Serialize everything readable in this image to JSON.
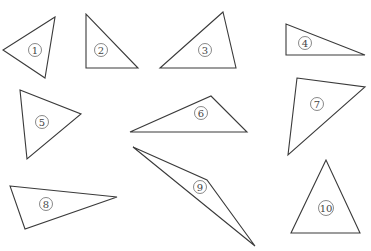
{
  "diagram": {
    "stroke_color": "#3a3a3a",
    "background": "#ffffff",
    "triangles": [
      {
        "label": "1",
        "points": "55,17 3,50 45,78",
        "label_x": 35,
        "label_y": 50
      },
      {
        "label": "2",
        "points": "86,14 86,68 138,68",
        "label_x": 101,
        "label_y": 50
      },
      {
        "label": "3",
        "points": "223,12 160,68 236,68",
        "label_x": 205,
        "label_y": 50
      },
      {
        "label": "4",
        "points": "286,24 286,55 365,55",
        "label_x": 305,
        "label_y": 43
      },
      {
        "label": "5",
        "points": "20,90 81,114 27,159",
        "label_x": 42,
        "label_y": 122
      },
      {
        "label": "6",
        "points": "130,132 211,96 247,132",
        "label_x": 201,
        "label_y": 113
      },
      {
        "label": "7",
        "points": "297,78 365,87 288,155",
        "label_x": 317,
        "label_y": 104
      },
      {
        "label": "8",
        "points": "10,186 117,197 25,229",
        "label_x": 46,
        "label_y": 204
      },
      {
        "label": "9",
        "points": "133,147 207,180 255,246",
        "label_x": 200,
        "label_y": 187
      },
      {
        "label": "10",
        "points": "326,160 291,233 360,233",
        "label_x": 326,
        "label_y": 208
      }
    ]
  }
}
